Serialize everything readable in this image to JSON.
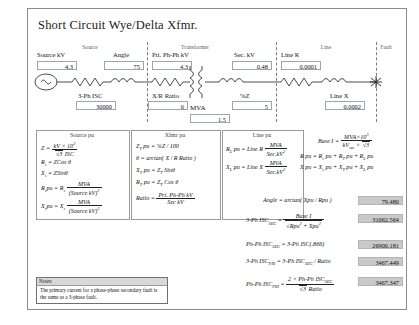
{
  "title": "Short Circuit Wye/Delta Xfmr.",
  "groups": [
    {
      "name": "Source",
      "label": "Source"
    },
    {
      "name": "Transformer",
      "label": "Transformer"
    },
    {
      "name": "Line",
      "label": "Line"
    },
    {
      "name": "Fault",
      "label": "Fault"
    }
  ],
  "inputs": [
    {
      "name": "source-kv",
      "label": "Source kV",
      "value": "4.3"
    },
    {
      "name": "angle",
      "label": "Angle",
      "value": "75"
    },
    {
      "name": "pri-ph-ph-kv",
      "label": "Pri. Ph-Ph kV",
      "value": "4.3"
    },
    {
      "name": "sec-kv",
      "label": "Sec. kV",
      "value": "0.48"
    },
    {
      "name": "line-r",
      "label": "Line R",
      "value": "0.0001"
    },
    {
      "name": "3ph-isc",
      "label": "3-Ph ISC",
      "value": "30000"
    },
    {
      "name": "xr-ratio",
      "label": "X/R Ratio",
      "value": "6"
    },
    {
      "name": "mva",
      "label": "MVA",
      "value": "1.5"
    },
    {
      "name": "percent-z",
      "label": "%Z",
      "value": "5"
    },
    {
      "name": "line-x",
      "label": "Line X",
      "value": "0.0002"
    }
  ],
  "formula_boxes": {
    "source_pu": {
      "heading": "Source pu",
      "lines": [
        "Z = kV x 10^3 / (sqrt3 ISC)",
        "R_s = ZCos theta",
        "X_s = ZSin theta",
        "R_s pu = R_s  MVA / (Source kV)^2",
        "X_s pu = X_s  MVA / (Source kV)^2"
      ]
    },
    "xfmr_pu": {
      "heading": "Xfmr pu",
      "lines": [
        "Z_T pu = %Z / 100",
        "theta = arctan( X / R Ratio )",
        "X_T pu = Z_T Sin theta",
        "R_T pu = Z_T Cos theta",
        "Ratio = Pri. Ph-Ph kV / Sec kV"
      ]
    },
    "line_pu": {
      "heading": "Line pu",
      "lines": [
        "R_L pu = Line R  MVA / Sec.kV^2",
        "X_L pu = Line X  MVA / Sec.kV^2"
      ]
    },
    "base": {
      "lines": [
        "Base I = MVA x 10^3 / (kV_sec x sqrt3)",
        "R pu = R_s pu + R_T pu + R_L pu",
        "X pu = X_s pu + X_T pu + X_L pu"
      ]
    }
  },
  "results": [
    {
      "name": "angle-result",
      "label": "Angle = arctan( Xpu / Rpu )",
      "value": "79.480"
    },
    {
      "name": "3ph-isc-sec-result",
      "label": "3-Ph ISC(SEC) = Base I / sqrt(Rpu^2+Xpu^2)",
      "value": "31062.564"
    },
    {
      "name": "phph-isc-sec-result",
      "label": "Ph-Ph ISC(SEC) = 3-Ph ISC(.866)",
      "value": "26900.181"
    },
    {
      "name": "3ph-isc-pri-result",
      "label": "3-Ph ISC(PRI) = 3-Ph ISC(SEC) / Ratio",
      "value": "3467.449"
    },
    {
      "name": "phph-isc-pri-result",
      "label": "Ph-Ph ISC(PRI) = 2 x Ph-Ph ISC(SEC) / (sqrt3 Ratio)",
      "value": "3467.347"
    }
  ],
  "notes": {
    "heading": "Notes:",
    "body": "The primary current for a phase-phase secondary fault is the same as a 3-phase fault."
  }
}
